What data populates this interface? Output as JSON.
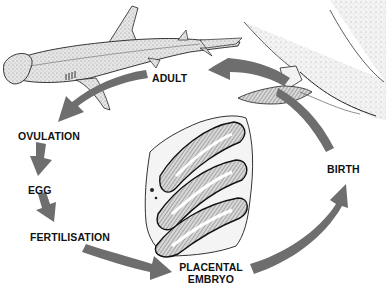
{
  "diagram": {
    "type": "life-cycle",
    "arrow_color": "#6e6e6e",
    "text_color": "#111111",
    "stages": [
      {
        "id": "adult",
        "label": "ADULT"
      },
      {
        "id": "ovulation",
        "label": "OVULATION"
      },
      {
        "id": "egg",
        "label": "EGG"
      },
      {
        "id": "fertilisation",
        "label": "FERTILISATION"
      },
      {
        "id": "placental-embryo",
        "label_line1": "PLACENTAL",
        "label_line2": "EMBRYO"
      },
      {
        "id": "birth",
        "label": "BIRTH"
      }
    ],
    "flow": [
      "adult",
      "ovulation",
      "egg",
      "fertilisation",
      "placental-embryo",
      "birth",
      "adult"
    ],
    "illustrations": [
      {
        "id": "hammerhead-shark",
        "depicts": "adult hammerhead shark"
      },
      {
        "id": "birth-scene",
        "depicts": "pup emerging from mother"
      },
      {
        "id": "uterus-section",
        "depicts": "cross-section of placental embryos in uterus"
      }
    ]
  }
}
